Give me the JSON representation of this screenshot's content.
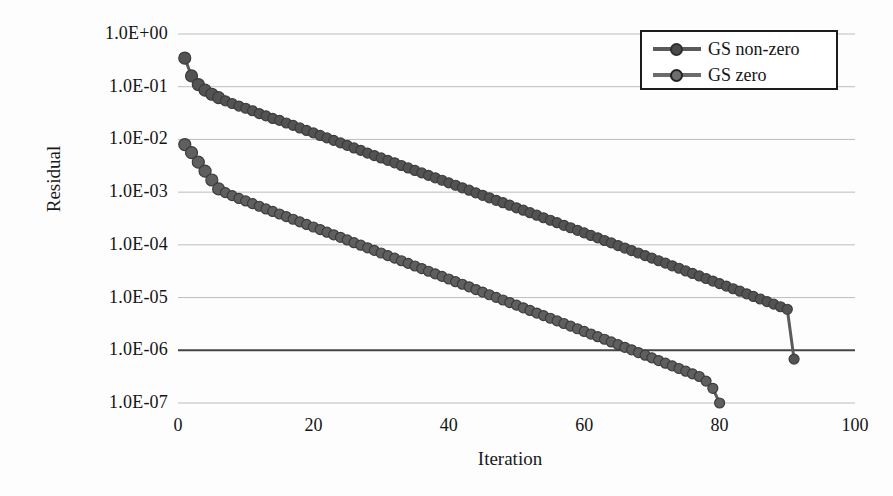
{
  "chart_data": {
    "type": "line",
    "title": "",
    "xlabel": "Iteration",
    "ylabel": "Residual",
    "xlim": [
      0,
      100
    ],
    "ylim": [
      1e-07,
      1
    ],
    "yscale": "log",
    "grid": true,
    "legend_position": "top-right",
    "xticks": [
      "0",
      "20",
      "40",
      "60",
      "80",
      "100"
    ],
    "xtick_values": [
      0,
      20,
      40,
      60,
      80,
      100
    ],
    "yticks": [
      "1.0E+00",
      "1.0E-01",
      "1.0E-02",
      "1.0E-03",
      "1.0E-04",
      "1.0E-05",
      "1.0E-06",
      "1.0E-07"
    ],
    "ytick_values": [
      1,
      0.1,
      0.01,
      0.001,
      0.0001,
      1e-05,
      1e-06,
      1e-07
    ],
    "series": [
      {
        "name": "GS non-zero",
        "color": "#5a5a5a",
        "edge_color": "#3c3c3c",
        "marker": "circle-filled",
        "x": [
          1,
          2,
          3,
          4,
          5,
          6,
          7,
          8,
          9,
          10,
          11,
          12,
          13,
          14,
          15,
          16,
          17,
          18,
          19,
          20,
          21,
          22,
          23,
          24,
          25,
          26,
          27,
          28,
          29,
          30,
          31,
          32,
          33,
          34,
          35,
          36,
          37,
          38,
          39,
          40,
          41,
          42,
          43,
          44,
          45,
          46,
          47,
          48,
          49,
          50,
          51,
          52,
          53,
          54,
          55,
          56,
          57,
          58,
          59,
          60,
          61,
          62,
          63,
          64,
          65,
          66,
          67,
          68,
          69,
          70,
          71,
          72,
          73,
          74,
          75,
          76,
          77,
          78,
          79,
          80,
          81,
          82,
          83,
          84,
          85,
          86,
          87,
          88,
          89,
          90,
          91
        ],
        "y": [
          0.35,
          0.16,
          0.11,
          0.086,
          0.072,
          0.062,
          0.054,
          0.048,
          0.043,
          0.039,
          0.035,
          0.031,
          0.028,
          0.025,
          0.023,
          0.0205,
          0.0185,
          0.0165,
          0.0148,
          0.0133,
          0.0119,
          0.0107,
          0.0096,
          0.0086,
          0.0077,
          0.0069,
          0.0062,
          0.0055,
          0.00495,
          0.00445,
          0.004,
          0.0036,
          0.0032,
          0.00288,
          0.00258,
          0.00232,
          0.00208,
          0.00187,
          0.00168,
          0.0015,
          0.00135,
          0.00121,
          0.00109,
          0.00097,
          0.00087,
          0.00078,
          0.0007,
          0.00063,
          0.000565,
          0.000505,
          0.000455,
          0.000407,
          0.000365,
          0.000327,
          0.000293,
          0.000263,
          0.000235,
          0.000211,
          0.000189,
          0.000169,
          0.000151,
          0.000136,
          0.000121,
          0.000109,
          9.7e-05,
          8.7e-05,
          7.8e-05,
          7e-05,
          6.25e-05,
          5.6e-05,
          5e-05,
          4.5e-05,
          4e-05,
          3.6e-05,
          3.2e-05,
          2.87e-05,
          2.57e-05,
          2.3e-05,
          2.06e-05,
          1.84e-05,
          1.65e-05,
          1.47e-05,
          1.32e-05,
          1.18e-05,
          1.05e-05,
          9.4e-06,
          8.4e-06,
          7.5e-06,
          6.7e-06,
          6e-06,
          6.8e-07
        ]
      },
      {
        "name": "GS zero",
        "color": "#5e5e5e",
        "edge_color": "#3c3c3c",
        "marker": "circle-open",
        "x": [
          1,
          2,
          3,
          4,
          5,
          6,
          7,
          8,
          9,
          10,
          11,
          12,
          13,
          14,
          15,
          16,
          17,
          18,
          19,
          20,
          21,
          22,
          23,
          24,
          25,
          26,
          27,
          28,
          29,
          30,
          31,
          32,
          33,
          34,
          35,
          36,
          37,
          38,
          39,
          40,
          41,
          42,
          43,
          44,
          45,
          46,
          47,
          48,
          49,
          50,
          51,
          52,
          53,
          54,
          55,
          56,
          57,
          58,
          59,
          60,
          61,
          62,
          63,
          64,
          65,
          66,
          67,
          68,
          69,
          70,
          71,
          72,
          73,
          74,
          75,
          76,
          77,
          78,
          79,
          80
        ],
        "y": [
          0.008,
          0.0056,
          0.0037,
          0.0025,
          0.0017,
          0.00115,
          0.00098,
          0.00086,
          0.00076,
          0.00068,
          0.000605,
          0.00054,
          0.00048,
          0.00043,
          0.000385,
          0.000343,
          0.000306,
          0.000273,
          0.000244,
          0.000218,
          0.000195,
          0.000174,
          0.000155,
          0.000139,
          0.000124,
          0.00011,
          9.85e-05,
          8.8e-05,
          7.85e-05,
          7e-05,
          6.25e-05,
          5.6e-05,
          5e-05,
          4.45e-05,
          3.97e-05,
          3.55e-05,
          3.16e-05,
          2.82e-05,
          2.52e-05,
          2.25e-05,
          2e-05,
          1.79e-05,
          1.6e-05,
          1.42e-05,
          1.27e-05,
          1.13e-05,
          1.01e-05,
          9e-06,
          8.05e-06,
          7.18e-06,
          6.4e-06,
          5.7e-06,
          5.09e-06,
          4.54e-06,
          4.05e-06,
          3.61e-06,
          3.22e-06,
          2.87e-06,
          2.56e-06,
          2.28e-06,
          2.03e-06,
          1.81e-06,
          1.62e-06,
          1.44e-06,
          1.28e-06,
          1.14e-06,
          1.02e-06,
          9.05e-07,
          8.06e-07,
          7.18e-07,
          6.39e-07,
          5.69e-07,
          5.07e-07,
          4.51e-07,
          4.01e-07,
          3.57e-07,
          3.18e-07,
          2.6e-07,
          1.9e-07,
          1e-07
        ]
      }
    ]
  },
  "axes": {
    "ylabel": "Residual",
    "xlabel": "Iteration"
  },
  "legend": {
    "items": [
      {
        "label": "GS non-zero",
        "marker": "circle-filled"
      },
      {
        "label": "GS zero",
        "marker": "circle-open"
      }
    ]
  },
  "colors": {
    "series_non_zero": "#5a5a5a",
    "series_zero": "#5e5e5e",
    "gridline": "#bdbdbd",
    "axis": "#444444",
    "text": "#141414"
  }
}
